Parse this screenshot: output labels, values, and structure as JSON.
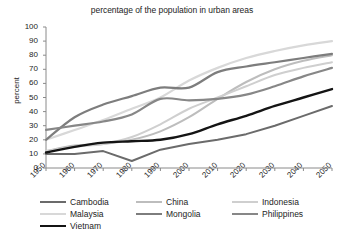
{
  "chart_data": {
    "type": "line",
    "title": "percentage of the population in urban areas",
    "xlabel": "",
    "ylabel": "percent",
    "ylim": [
      0,
      100
    ],
    "xlim": [
      1950,
      2050
    ],
    "grid": false,
    "legend_position": "bottom",
    "yticks": [
      0,
      10,
      20,
      30,
      40,
      50,
      60,
      70,
      80,
      90,
      100
    ],
    "categories": [
      1950,
      1960,
      1970,
      1980,
      1990,
      2000,
      2010,
      2020,
      2030,
      2040,
      2050
    ],
    "x": [
      1950,
      1960,
      1970,
      1980,
      1990,
      2000,
      2010,
      2020,
      2030,
      2040,
      2050
    ],
    "series": [
      {
        "name": "Cambodia",
        "color": "#6b6b6b",
        "width": 2.0,
        "values": [
          10,
          10,
          12,
          5,
          13,
          17,
          20,
          24,
          30,
          37,
          44
        ]
      },
      {
        "name": "China",
        "color": "#bdbdbd",
        "width": 2.0,
        "values": [
          12,
          16,
          17,
          20,
          26,
          36,
          49,
          61,
          70,
          76,
          80
        ]
      },
      {
        "name": "Indonesia",
        "color": "#cfcfcf",
        "width": 2.0,
        "values": [
          12,
          15,
          17,
          22,
          31,
          42,
          50,
          58,
          66,
          71,
          75
        ]
      },
      {
        "name": "Malaysia",
        "color": "#d8d8d8",
        "width": 2.2,
        "values": [
          20,
          27,
          34,
          42,
          50,
          62,
          71,
          78,
          83,
          87,
          90
        ]
      },
      {
        "name": "Mongolia",
        "color": "#7d7d7d",
        "width": 2.2,
        "values": [
          20,
          36,
          45,
          51,
          57,
          57,
          68,
          72,
          75,
          78,
          81
        ]
      },
      {
        "name": "Philippines",
        "color": "#878787",
        "width": 2.2,
        "values": [
          27,
          30,
          33,
          38,
          49,
          48,
          49,
          52,
          58,
          65,
          71
        ]
      },
      {
        "name": "Vietnam",
        "color": "#141414",
        "width": 2.4,
        "values": [
          11,
          15,
          18,
          19,
          20,
          24,
          31,
          37,
          44,
          50,
          56
        ]
      }
    ]
  },
  "axis": {
    "y_title": "percent",
    "y_ticks": [
      "100",
      "90",
      "80",
      "70",
      "60",
      "50",
      "40",
      "30",
      "20",
      "10",
      "0"
    ],
    "x_ticks": [
      "1950",
      "1960",
      "1970",
      "1980",
      "1990",
      "2000",
      "2010",
      "2020",
      "2030",
      "2040",
      "2050"
    ]
  },
  "legend": {
    "rows": [
      [
        {
          "label": "Cambodia",
          "color": "#6b6b6b",
          "width": 2.0
        },
        {
          "label": "China",
          "color": "#bdbdbd",
          "width": 2.0
        },
        {
          "label": "Indonesia",
          "color": "#cfcfcf",
          "width": 2.0
        }
      ],
      [
        {
          "label": "Malaysia",
          "color": "#d8d8d8",
          "width": 2.2
        },
        {
          "label": "Mongolia",
          "color": "#7d7d7d",
          "width": 2.2
        },
        {
          "label": "Philippines",
          "color": "#878787",
          "width": 2.2
        }
      ],
      [
        {
          "label": "Vietnam",
          "color": "#141414",
          "width": 2.4
        }
      ]
    ]
  }
}
